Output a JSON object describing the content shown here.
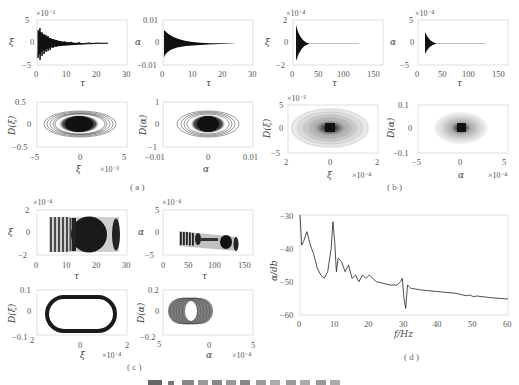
{
  "figure": {
    "panels": {
      "a": {
        "label": "( a )"
      },
      "b": {
        "label": "( b )"
      },
      "c": {
        "label": "( c )"
      },
      "d": {
        "label": "( d )"
      }
    },
    "caption_partial": "图 … (truncated)"
  },
  "chart_data": [
    {
      "id": "a-xi-time",
      "type": "line",
      "title": "",
      "xlabel": "τ",
      "ylabel": "ξ",
      "xlim": [
        0,
        30
      ],
      "ylim": [
        -5,
        5
      ],
      "y_scale_note": "×10⁻³",
      "xticks": [
        "0",
        "10",
        "20",
        "30"
      ],
      "yticks": [
        "-5",
        "0",
        "5"
      ],
      "description": "Decaying oscillation starting at τ≈0 with amplitude ≈4×10⁻³, decaying to ~0 by τ≈24"
    },
    {
      "id": "a-alpha-time",
      "type": "line",
      "xlabel": "τ",
      "ylabel": "α",
      "xlim": [
        0,
        30
      ],
      "ylim": [
        -0.01,
        0.01
      ],
      "xticks": [
        "0",
        "10",
        "20",
        "30"
      ],
      "yticks": [
        "-0.01",
        "0",
        "0.01"
      ],
      "description": "Decaying oscillation, amplitude ≈0.008 at start, ~0 by τ≈24"
    },
    {
      "id": "b-xi-time",
      "type": "line",
      "xlabel": "τ",
      "ylabel": "ξ",
      "xlim": [
        0,
        150
      ],
      "ylim": [
        -2,
        2
      ],
      "y_scale_note": "×10⁻⁴",
      "xticks": [
        "0",
        "50",
        "100",
        "150"
      ],
      "yticks": [
        "-2",
        "0",
        "2"
      ],
      "description": "Sharp decaying oscillation starting at τ≈10 (amplitude ≈1.6×10⁻⁴), flat to τ≈120"
    },
    {
      "id": "b-alpha-time",
      "type": "line",
      "xlabel": "τ",
      "ylabel": "α",
      "xlim": [
        0,
        150
      ],
      "ylim": [
        -5,
        5
      ],
      "y_scale_note": "×10⁻⁴",
      "xticks": [
        "0",
        "50",
        "100",
        "150"
      ],
      "yticks": [
        "-5",
        "0",
        "5"
      ],
      "description": "Sharp decaying oscillation starting at τ≈10 (amplitude ≈3×10⁻⁴), flat to τ≈120"
    },
    {
      "id": "a-xi-phase",
      "type": "scatter",
      "xlabel": "ξ",
      "ylabel": "D(ξ)",
      "xlim": [
        -5,
        5
      ],
      "ylim": [
        -0.5,
        0.5
      ],
      "x_scale_note": "×10⁻³",
      "xticks": [
        "-5",
        "0",
        "5"
      ],
      "yticks": [
        "-0.5",
        "0",
        "0.5"
      ],
      "description": "Nested elliptical spiral converging to origin; outer ellipse half-width ≈4×10⁻³, half-height ≈0.3"
    },
    {
      "id": "a-alpha-phase",
      "type": "scatter",
      "xlabel": "α",
      "ylabel": "D(α)",
      "xlim": [
        -0.01,
        0.01
      ],
      "ylim": [
        -1,
        1
      ],
      "xticks": [
        "-0.01",
        "0",
        "0.01"
      ],
      "yticks": [
        "-1",
        "0",
        "1"
      ],
      "description": "Nested elliptical spiral converging to origin; outer half-width ≈0.0085, half-height ≈0.55"
    },
    {
      "id": "b-xi-phase",
      "type": "scatter",
      "xlabel": "ξ",
      "ylabel": "D(ξ)",
      "xlim": [
        -2,
        2
      ],
      "ylim": [
        -5,
        5
      ],
      "x_scale_note": "×10⁻⁴",
      "y_scale_note": "×10⁻³",
      "xticks": [
        "-2",
        "0",
        "2"
      ],
      "yticks": [
        "-5",
        "0",
        "5"
      ],
      "description": "Dense elliptical spiral, outer half-width ≈1.6×10⁻⁴, dark core at origin"
    },
    {
      "id": "b-alpha-phase",
      "type": "scatter",
      "xlabel": "α",
      "ylabel": "D(α)",
      "xlim": [
        -5,
        5
      ],
      "ylim": [
        -0.1,
        0.1
      ],
      "x_scale_note": "×10⁻⁴",
      "xticks": [
        "-5",
        "0",
        "5"
      ],
      "yticks": [
        "-0.1",
        "0",
        "0.1"
      ],
      "description": "Dense elliptical spiral, outer half-width ≈3×10⁻⁴, dark core at origin"
    },
    {
      "id": "c-xi-time",
      "type": "line",
      "xlabel": "τ",
      "ylabel": "ξ",
      "xlim": [
        0,
        30
      ],
      "ylim": [
        -2,
        2
      ],
      "y_scale_note": "×10⁻⁴",
      "xticks": [
        "0",
        "10",
        "20",
        "30"
      ],
      "yticks": [
        "-2",
        "0",
        "2"
      ],
      "description": "Sustained (limit-cycle) oscillation from τ≈5 to τ≈24, amplitude ≈1.5×10⁻⁴, beating envelope"
    },
    {
      "id": "c-alpha-time",
      "type": "line",
      "xlabel": "τ",
      "ylabel": "α",
      "xlim": [
        0,
        150
      ],
      "ylim": [
        -5,
        5
      ],
      "y_scale_note": "×10⁻⁴",
      "xticks": [
        "0",
        "50",
        "100",
        "150"
      ],
      "yticks": [
        "-5",
        "0",
        "5"
      ],
      "description": "Sustained oscillation band from τ≈25 to τ≈120, centred near -2×10⁻⁴ drifting to -3×10⁻⁴, beating envelope"
    },
    {
      "id": "c-xi-phase",
      "type": "scatter",
      "xlabel": "ξ",
      "ylabel": "D(ξ)",
      "xlim": [
        -2,
        2
      ],
      "ylim": [
        -0.1,
        0.1
      ],
      "x_scale_note": "×10⁻⁴",
      "xticks": [
        "-2",
        "0",
        "2"
      ],
      "yticks": [
        "-0.1",
        "0",
        "0.1"
      ],
      "description": "Thick stadium-shaped limit cycle, half-width ≈1.5×10⁻⁴, half-height ≈0.08"
    },
    {
      "id": "c-alpha-phase",
      "type": "scatter",
      "xlabel": "α",
      "ylabel": "D(α)",
      "xlim": [
        -5,
        5
      ],
      "ylim": [
        -0.2,
        0.2
      ],
      "x_scale_note": "×10⁻⁴",
      "xticks": [
        "-5",
        "0",
        "5"
      ],
      "yticks": [
        "-0.2",
        "0",
        "0.2"
      ],
      "description": "Band of overlapping ellipses centred near α≈-2×10⁻⁴, spanning about -4.5 to 0.5 ×10⁻⁴, half-height ≈0.1"
    },
    {
      "id": "d-spectrum",
      "type": "line",
      "title": "",
      "xlabel": "f/Hz",
      "ylabel": "α/db",
      "xlim": [
        0,
        60
      ],
      "ylim": [
        -60,
        -30
      ],
      "xticks": [
        "0",
        "10",
        "20",
        "30",
        "40",
        "50",
        "60"
      ],
      "yticks": [
        "-60",
        "-50",
        "-40",
        "-30"
      ],
      "grid": false,
      "x": [
        0,
        0.5,
        1,
        2,
        3,
        4,
        5,
        6,
        7,
        8,
        9,
        9.5,
        10,
        10.5,
        11,
        12,
        13,
        14,
        15,
        16,
        17,
        18,
        19,
        20,
        22,
        24,
        26,
        28,
        29,
        29.5,
        30,
        30.5,
        31,
        32,
        35,
        40,
        45,
        47,
        48,
        49,
        50,
        51,
        55,
        60
      ],
      "y": [
        -30,
        -39,
        -38,
        -35,
        -39,
        -42,
        -46,
        -48,
        -49,
        -47,
        -40,
        -32,
        -38,
        -47,
        -43,
        -44,
        -47,
        -45,
        -49,
        -48,
        -50,
        -48,
        -49,
        -48,
        -50,
        -50.5,
        -51,
        -51,
        -50,
        -49,
        -55,
        -58,
        -51,
        -52,
        -52.5,
        -53,
        -53.5,
        -54,
        -54.2,
        -54,
        -54.5,
        -54.3,
        -54.8,
        -55.2
      ]
    }
  ],
  "colors": {
    "trace": "#1a1a1a",
    "axes": "#d8d8d8",
    "text": "#555555"
  }
}
